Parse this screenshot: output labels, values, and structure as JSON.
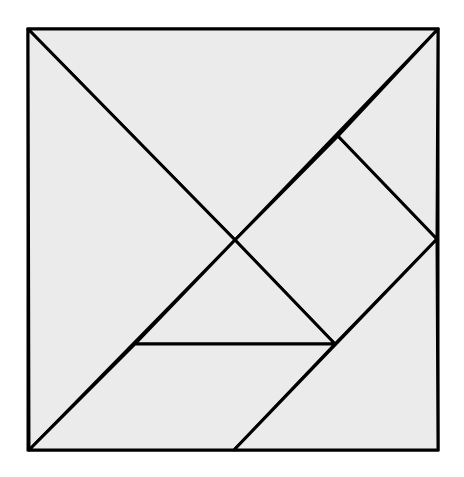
{
  "diagram": {
    "title": "",
    "type": "tangram-square",
    "colors": {
      "background": "#ffffff",
      "fill": "#ebebeb",
      "stroke": "#000000"
    },
    "stroke_width": 3,
    "outer_square": {
      "x": 28,
      "y": 29,
      "width": 410,
      "height": 421
    },
    "points": {
      "TL": [
        28,
        29
      ],
      "TR": [
        438,
        29
      ],
      "BR": [
        438,
        450
      ],
      "BL": [
        29,
        450
      ],
      "C": [
        235,
        240
      ],
      "SQ_TOP": [
        338,
        136
      ],
      "SQ_RIGHT": [
        437,
        239
      ],
      "SQ_BOTTOM": [
        335,
        344
      ],
      "H_LEFT": [
        135,
        344
      ],
      "PAR_BOTTOM": [
        234,
        450
      ]
    },
    "pieces": [
      {
        "name": "large-triangle-top",
        "points": "28,29 438,29 235,240"
      },
      {
        "name": "large-triangle-left",
        "points": "28,29 235,240 29,450"
      },
      {
        "name": "square",
        "points": "235,240 338,136 437,239 335,344"
      },
      {
        "name": "small-triangle-top-right",
        "points": "338,136 438,29 437,239"
      },
      {
        "name": "small-triangle-center",
        "points": "235,240 335,344 135,344"
      },
      {
        "name": "parallelogram",
        "points": "135,344 335,344 234,450 29,450"
      },
      {
        "name": "medium-triangle-bottom-right",
        "points": "437,239 438,450 234,450"
      }
    ]
  }
}
